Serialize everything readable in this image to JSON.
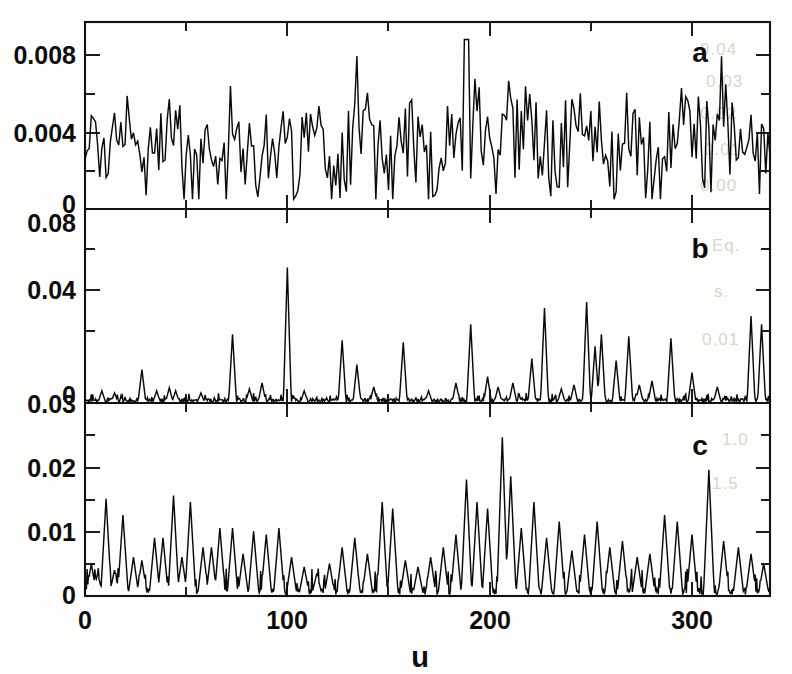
{
  "figure": {
    "title": "",
    "background_color": "#fdfdfb",
    "ink_color": "#0a0a0a"
  },
  "chart_data": {
    "type": "line",
    "title": "",
    "xlabel": "u",
    "ylabel": "",
    "grid": false,
    "legend": "none",
    "shared_x_axis": true,
    "x": {
      "label": "u",
      "min": 0,
      "max": 325,
      "ticks": [
        0,
        100,
        200,
        300
      ],
      "tick_labels": [
        "0",
        "100",
        "200",
        "300"
      ],
      "minor_tick_interval": 50
    },
    "panels": [
      {
        "id": "a",
        "letter": "a",
        "letter_position": "top-right",
        "ylim": [
          0,
          0.0095
        ],
        "yticks": [
          0,
          0.004,
          0.008
        ],
        "ytick_labels": [
          "0",
          "0.004",
          "0.008"
        ],
        "minor_yticks": [
          0.002,
          0.006
        ],
        "character": "dense broadband noise, no silent baseline",
        "series_name": "a",
        "n_points": 325,
        "mean": 0.0033,
        "min_value": 0.0005,
        "max_value": 0.0087,
        "max_at_u": 181,
        "noise_seed": 20719,
        "description": "Densely fluctuating signal filling the band between ~0.0005 and ~0.0087, mean near 0.0033; every sample is non-zero."
      },
      {
        "id": "b",
        "letter": "b",
        "letter_position": "top-right",
        "ylim": [
          0,
          0.095
        ],
        "yticks": [
          0,
          0.04,
          0.08
        ],
        "ytick_labels": [
          "0",
          "0.04",
          "0.08"
        ],
        "minor_yticks": [
          0.02,
          0.06
        ],
        "character": "sparse isolated narrow spikes on a near-zero baseline",
        "series_name": "b",
        "n_points": 325,
        "baseline": 0.0015,
        "max_value": 0.067,
        "max_at_u": 96,
        "noise_seed": 48231,
        "spikes": [
          {
            "u": 8,
            "value": 0.006
          },
          {
            "u": 14,
            "value": 0.005
          },
          {
            "u": 27,
            "value": 0.0165
          },
          {
            "u": 34,
            "value": 0.006
          },
          {
            "u": 40,
            "value": 0.0075
          },
          {
            "u": 43,
            "value": 0.006
          },
          {
            "u": 55,
            "value": 0.005
          },
          {
            "u": 70,
            "value": 0.034
          },
          {
            "u": 78,
            "value": 0.007
          },
          {
            "u": 84,
            "value": 0.01
          },
          {
            "u": 96,
            "value": 0.067
          },
          {
            "u": 104,
            "value": 0.006
          },
          {
            "u": 122,
            "value": 0.031
          },
          {
            "u": 129,
            "value": 0.019
          },
          {
            "u": 137,
            "value": 0.008
          },
          {
            "u": 151,
            "value": 0.03
          },
          {
            "u": 163,
            "value": 0.006
          },
          {
            "u": 176,
            "value": 0.01
          },
          {
            "u": 183,
            "value": 0.039
          },
          {
            "u": 191,
            "value": 0.013
          },
          {
            "u": 196,
            "value": 0.008
          },
          {
            "u": 203,
            "value": 0.01
          },
          {
            "u": 212,
            "value": 0.022
          },
          {
            "u": 218,
            "value": 0.047
          },
          {
            "u": 226,
            "value": 0.007
          },
          {
            "u": 232,
            "value": 0.009
          },
          {
            "u": 238,
            "value": 0.05
          },
          {
            "u": 242,
            "value": 0.028
          },
          {
            "u": 245,
            "value": 0.034
          },
          {
            "u": 252,
            "value": 0.021
          },
          {
            "u": 258,
            "value": 0.033
          },
          {
            "u": 263,
            "value": 0.009
          },
          {
            "u": 269,
            "value": 0.011
          },
          {
            "u": 278,
            "value": 0.032
          },
          {
            "u": 288,
            "value": 0.015
          },
          {
            "u": 300,
            "value": 0.008
          },
          {
            "u": 316,
            "value": 0.043
          },
          {
            "u": 321,
            "value": 0.039
          }
        ],
        "description": "Sparse delta-like peaks; largest 0.067 near u=96, a cluster of tall spikes between u=180 and u=280, and a late pair near u=316-321."
      },
      {
        "id": "c",
        "letter": "c",
        "letter_position": "top-right",
        "ylim": [
          0,
          0.0295
        ],
        "yticks": [
          0,
          0.01,
          0.02,
          0.03
        ],
        "ytick_labels": [
          "0",
          "0.01",
          "0.02",
          "0.03"
        ],
        "minor_yticks": [
          0.005,
          0.015,
          0.025
        ],
        "character": "intermediate density spiky signal touching zero between peaks",
        "series_name": "c",
        "n_points": 325,
        "baseline": 0.0008,
        "max_value": 0.0245,
        "max_at_u": 198,
        "noise_seed": 91537,
        "spikes": [
          {
            "u": 3,
            "value": 0.005
          },
          {
            "u": 6,
            "value": 0.0035
          },
          {
            "u": 10,
            "value": 0.015
          },
          {
            "u": 14,
            "value": 0.004
          },
          {
            "u": 18,
            "value": 0.0125
          },
          {
            "u": 23,
            "value": 0.006
          },
          {
            "u": 27,
            "value": 0.0055
          },
          {
            "u": 33,
            "value": 0.009
          },
          {
            "u": 37,
            "value": 0.009
          },
          {
            "u": 42,
            "value": 0.0155
          },
          {
            "u": 46,
            "value": 0.006
          },
          {
            "u": 50,
            "value": 0.0145
          },
          {
            "u": 56,
            "value": 0.0075
          },
          {
            "u": 60,
            "value": 0.0075
          },
          {
            "u": 64,
            "value": 0.0105
          },
          {
            "u": 70,
            "value": 0.0105
          },
          {
            "u": 75,
            "value": 0.0065
          },
          {
            "u": 80,
            "value": 0.01
          },
          {
            "u": 86,
            "value": 0.0095
          },
          {
            "u": 92,
            "value": 0.0105
          },
          {
            "u": 98,
            "value": 0.006
          },
          {
            "u": 104,
            "value": 0.0045
          },
          {
            "u": 110,
            "value": 0.0035
          },
          {
            "u": 116,
            "value": 0.005
          },
          {
            "u": 122,
            "value": 0.0075
          },
          {
            "u": 128,
            "value": 0.009
          },
          {
            "u": 134,
            "value": 0.0065
          },
          {
            "u": 141,
            "value": 0.0145
          },
          {
            "u": 146,
            "value": 0.0135
          },
          {
            "u": 152,
            "value": 0.0055
          },
          {
            "u": 158,
            "value": 0.0045
          },
          {
            "u": 164,
            "value": 0.006
          },
          {
            "u": 170,
            "value": 0.0075
          },
          {
            "u": 176,
            "value": 0.0095
          },
          {
            "u": 181,
            "value": 0.018
          },
          {
            "u": 186,
            "value": 0.0145
          },
          {
            "u": 191,
            "value": 0.0135
          },
          {
            "u": 198,
            "value": 0.0245
          },
          {
            "u": 202,
            "value": 0.0185
          },
          {
            "u": 207,
            "value": 0.0105
          },
          {
            "u": 213,
            "value": 0.0145
          },
          {
            "u": 219,
            "value": 0.009
          },
          {
            "u": 225,
            "value": 0.0115
          },
          {
            "u": 231,
            "value": 0.007
          },
          {
            "u": 237,
            "value": 0.0095
          },
          {
            "u": 243,
            "value": 0.0115
          },
          {
            "u": 249,
            "value": 0.0075
          },
          {
            "u": 255,
            "value": 0.0085
          },
          {
            "u": 262,
            "value": 0.006
          },
          {
            "u": 268,
            "value": 0.0065
          },
          {
            "u": 275,
            "value": 0.0125
          },
          {
            "u": 281,
            "value": 0.0115
          },
          {
            "u": 288,
            "value": 0.0095
          },
          {
            "u": 296,
            "value": 0.0195
          },
          {
            "u": 303,
            "value": 0.0085
          },
          {
            "u": 310,
            "value": 0.0075
          },
          {
            "u": 316,
            "value": 0.0065
          },
          {
            "u": 322,
            "value": 0.005
          }
        ],
        "description": "Moderately dense peaks returning to zero; tallest peak 0.0245 near u=198, a secondary 0.0195 near u=296, and a 0.015 peak near u=10."
      }
    ]
  },
  "bleed_through": [
    {
      "text": "0.04",
      "x": 700,
      "y": 40
    },
    {
      "text": "0.03",
      "x": 706,
      "y": 72
    },
    {
      "text": "0.02",
      "x": 700,
      "y": 104
    },
    {
      "text": "0.01",
      "x": 704,
      "y": 140
    },
    {
      "text": "0.00",
      "x": 700,
      "y": 176
    },
    {
      "text": "Eq.",
      "x": 712,
      "y": 236
    },
    {
      "text": "s.",
      "x": 714,
      "y": 282
    },
    {
      "text": "0.01",
      "x": 702,
      "y": 330
    },
    {
      "text": "1.0",
      "x": 722,
      "y": 430
    },
    {
      "text": "1.5",
      "x": 712,
      "y": 474
    }
  ]
}
